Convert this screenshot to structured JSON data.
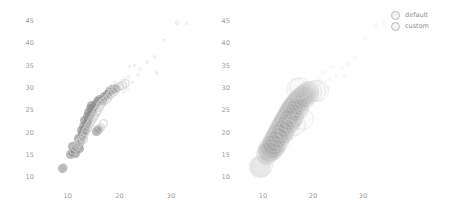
{
  "figure": {
    "background": "#ffffff",
    "tick_color": "#9a9a9a",
    "panels": [
      "left",
      "right"
    ]
  },
  "legend": {
    "position": "upper-right",
    "entries": [
      {
        "label": "default",
        "marker": "open-circle",
        "color": "#b0b0b0"
      },
      {
        "label": "custom",
        "marker": "open-circle",
        "color": "#c8c8c8"
      }
    ]
  },
  "chart_data": {
    "type": "scatter",
    "title": "",
    "xlabel": "",
    "ylabel": "",
    "xlim": [
      5,
      36
    ],
    "ylim": [
      8.5,
      47
    ],
    "xticks": [
      10,
      20,
      30
    ],
    "yticks": [
      10,
      15,
      20,
      25,
      30,
      35,
      40,
      45
    ],
    "grid": false,
    "legend_position": "upper right",
    "panels": [
      {
        "name": "left",
        "marker_scale": "small",
        "series": [
          {
            "name": "default",
            "color": "#8c8c8c",
            "style": "filled",
            "points": [
              [
                9.0,
                12.0
              ],
              [
                10.6,
                15.1
              ],
              [
                10.9,
                15.6
              ],
              [
                11.2,
                16.2
              ],
              [
                11.0,
                17.0
              ],
              [
                11.6,
                16.8
              ],
              [
                11.9,
                17.4
              ],
              [
                12.1,
                17.1
              ],
              [
                12.4,
                18.0
              ],
              [
                12.0,
                18.6
              ],
              [
                12.6,
                19.0
              ],
              [
                12.9,
                19.5
              ],
              [
                13.1,
                20.1
              ],
              [
                12.7,
                20.4
              ],
              [
                13.4,
                20.8
              ],
              [
                13.0,
                21.3
              ],
              [
                13.6,
                21.8
              ],
              [
                13.9,
                22.3
              ],
              [
                13.3,
                22.7
              ],
              [
                14.1,
                23.0
              ],
              [
                13.8,
                23.5
              ],
              [
                14.4,
                24.0
              ],
              [
                14.0,
                24.4
              ],
              [
                14.7,
                24.9
              ],
              [
                14.3,
                25.3
              ],
              [
                15.0,
                25.7
              ],
              [
                14.6,
                26.1
              ],
              [
                15.3,
                26.4
              ],
              [
                15.8,
                26.9
              ],
              [
                16.2,
                27.4
              ],
              [
                16.7,
                27.1
              ],
              [
                17.1,
                28.0
              ],
              [
                17.6,
                28.6
              ],
              [
                18.1,
                29.2
              ],
              [
                18.6,
                29.6
              ],
              [
                19.2,
                29.9
              ],
              [
                15.6,
                20.2
              ],
              [
                16.0,
                20.6
              ],
              [
                12.2,
                16.4
              ],
              [
                11.4,
                15.3
              ]
            ]
          },
          {
            "name": "custom",
            "color": "#cfcfcf",
            "style": "open",
            "points": [
              [
                9.2,
                12.3
              ],
              [
                10.8,
                15.4
              ],
              [
                11.1,
                16.0
              ],
              [
                11.5,
                16.6
              ],
              [
                11.8,
                17.2
              ],
              [
                12.2,
                17.8
              ],
              [
                12.5,
                18.3
              ],
              [
                12.8,
                18.9
              ],
              [
                13.2,
                19.6
              ],
              [
                13.5,
                20.2
              ],
              [
                13.8,
                20.9
              ],
              [
                14.0,
                21.5
              ],
              [
                14.3,
                22.1
              ],
              [
                14.6,
                22.7
              ],
              [
                14.9,
                23.3
              ],
              [
                15.2,
                23.9
              ],
              [
                15.5,
                24.5
              ],
              [
                15.8,
                25.0
              ],
              [
                16.1,
                25.6
              ],
              [
                16.4,
                26.2
              ],
              [
                16.8,
                26.7
              ],
              [
                17.2,
                27.2
              ],
              [
                17.6,
                27.7
              ],
              [
                18.0,
                28.2
              ],
              [
                18.5,
                28.7
              ],
              [
                19.0,
                29.3
              ],
              [
                19.5,
                29.8
              ],
              [
                20.0,
                30.3
              ],
              [
                20.6,
                30.6
              ],
              [
                21.2,
                31.0
              ],
              [
                15.9,
                20.8
              ],
              [
                16.3,
                21.2
              ],
              [
                17.0,
                22.0
              ],
              [
                12.0,
                17.5
              ],
              [
                13.0,
                18.4
              ]
            ]
          },
          {
            "name": "sparse-tail",
            "color": "#e3e3e3",
            "style": "open",
            "points": [
              [
                20.4,
                31.6
              ],
              [
                21.0,
                32.0
              ],
              [
                21.8,
                32.4
              ],
              [
                22.5,
                31.2
              ],
              [
                20.0,
                30.8
              ],
              [
                22.0,
                34.8
              ],
              [
                22.9,
                35.0
              ],
              [
                24.0,
                34.2
              ],
              [
                25.4,
                35.8
              ],
              [
                26.8,
                36.9
              ],
              [
                27.2,
                33.4
              ],
              [
                28.6,
                40.6
              ],
              [
                31.2,
                44.5
              ],
              [
                33.0,
                44.4
              ],
              [
                19.0,
                31.2
              ],
              [
                18.4,
                30.4
              ],
              [
                23.6,
                33.0
              ],
              [
                20.8,
                29.0
              ],
              [
                17.8,
                30.0
              ],
              [
                21.5,
                29.6
              ]
            ]
          }
        ]
      },
      {
        "name": "right",
        "marker_scale": "large",
        "series": [
          {
            "name": "default",
            "color": "#9e9e9e",
            "style": "filled",
            "points": [
              [
                9.4,
                12.2
              ],
              [
                10.8,
                15.2
              ],
              [
                11.2,
                16.0
              ],
              [
                11.6,
                16.8
              ],
              [
                11.9,
                17.5
              ],
              [
                12.2,
                18.2
              ],
              [
                12.5,
                18.8
              ],
              [
                12.8,
                19.4
              ],
              [
                13.1,
                20.0
              ],
              [
                13.4,
                20.7
              ],
              [
                13.7,
                21.3
              ],
              [
                14.0,
                21.9
              ],
              [
                14.3,
                22.5
              ],
              [
                14.6,
                23.1
              ],
              [
                14.9,
                23.7
              ],
              [
                15.2,
                24.3
              ],
              [
                15.5,
                24.9
              ],
              [
                15.8,
                25.4
              ],
              [
                16.1,
                26.0
              ],
              [
                16.5,
                26.5
              ],
              [
                16.9,
                27.0
              ],
              [
                17.3,
                27.5
              ],
              [
                17.8,
                28.0
              ],
              [
                18.3,
                28.5
              ],
              [
                18.9,
                29.0
              ],
              [
                12.0,
                16.4
              ],
              [
                12.4,
                17.0
              ],
              [
                13.0,
                18.0
              ],
              [
                13.8,
                19.8
              ],
              [
                15.0,
                22.0
              ],
              [
                16.0,
                23.4
              ],
              [
                17.0,
                25.2
              ],
              [
                11.4,
                15.8
              ],
              [
                14.2,
                20.4
              ],
              [
                15.6,
                22.8
              ]
            ]
          },
          {
            "name": "custom",
            "color": "#d4d4d4",
            "style": "open",
            "points": [
              [
                9.8,
                12.6
              ],
              [
                11.0,
                15.6
              ],
              [
                11.5,
                16.4
              ],
              [
                12.0,
                17.3
              ],
              [
                12.4,
                18.1
              ],
              [
                12.9,
                18.9
              ],
              [
                13.3,
                19.7
              ],
              [
                13.7,
                20.5
              ],
              [
                14.1,
                21.3
              ],
              [
                14.5,
                22.0
              ],
              [
                14.9,
                22.8
              ],
              [
                15.3,
                23.5
              ],
              [
                15.7,
                24.2
              ],
              [
                16.1,
                24.9
              ],
              [
                16.5,
                25.6
              ],
              [
                16.9,
                26.2
              ],
              [
                17.4,
                26.8
              ],
              [
                17.9,
                27.4
              ],
              [
                18.4,
                28.0
              ],
              [
                19.0,
                28.6
              ],
              [
                19.6,
                29.1
              ],
              [
                20.3,
                29.4
              ],
              [
                21.0,
                29.3
              ],
              [
                16.8,
                29.8
              ],
              [
                17.4,
                29.9
              ],
              [
                15.0,
                20.6
              ],
              [
                16.4,
                21.6
              ],
              [
                18.0,
                23.0
              ]
            ]
          },
          {
            "name": "sparse-tail",
            "color": "#ececec",
            "style": "open",
            "points": [
              [
                21.6,
                30.8
              ],
              [
                22.4,
                31.4
              ],
              [
                23.4,
                32.0
              ],
              [
                24.6,
                33.0
              ],
              [
                22.0,
                33.6
              ],
              [
                25.8,
                34.4
              ],
              [
                27.0,
                35.4
              ],
              [
                23.0,
                30.2
              ],
              [
                28.4,
                37.0
              ],
              [
                30.4,
                41.0
              ],
              [
                32.6,
                44.2
              ],
              [
                34.2,
                44.6
              ],
              [
                20.8,
                30.0
              ],
              [
                19.8,
                30.4
              ],
              [
                26.2,
                32.6
              ],
              [
                24.0,
                34.8
              ],
              [
                21.2,
                31.8
              ]
            ]
          }
        ]
      }
    ]
  }
}
